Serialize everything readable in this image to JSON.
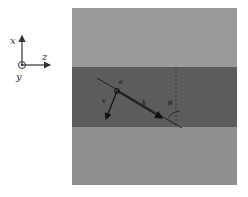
{
  "axes": {
    "x_label": "x",
    "y_label": "y",
    "z_label": "z"
  },
  "diagram": {
    "layers": [
      {
        "name": "upper-medium",
        "color": "#9a9a9a"
      },
      {
        "name": "slab",
        "color": "#5c5c5c"
      },
      {
        "name": "lower-medium",
        "color": "#8f8f8f"
      }
    ],
    "labels": {
      "particle_label": "e",
      "velocity_label": "v",
      "wavevector_label": "k",
      "angle_label": "θ"
    }
  }
}
